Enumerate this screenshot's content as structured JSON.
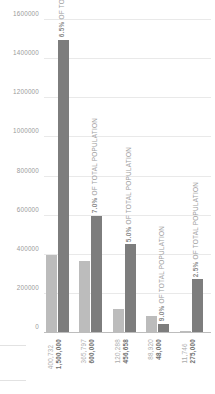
{
  "chart_data": {
    "type": "bar",
    "title": "",
    "subtitle": "",
    "xlabel": "",
    "ylabel": "",
    "ylim": [
      0,
      1600000
    ],
    "yticks": [
      0,
      200000,
      400000,
      600000,
      800000,
      1000000,
      1200000,
      1400000,
      1600000
    ],
    "ytick_labels": [
      "0",
      "200000",
      "400000",
      "600000",
      "800000",
      "1000000",
      "1200000",
      "1400000",
      "1600000"
    ],
    "grid": true,
    "legend": "none",
    "orientation": "vertical",
    "categories": [
      "1",
      "2",
      "3",
      "4",
      "5"
    ],
    "series": [
      {
        "name": "actual",
        "color": "#bcbcbc",
        "values": [
          400732,
          365797,
          120288,
          88920,
          11746
        ],
        "labels": [
          "400,732",
          "365,797",
          "120,288",
          "88,920",
          "11,746"
        ]
      },
      {
        "name": "target",
        "color": "#7d7d7d",
        "values": [
          1500000,
          600000,
          456658,
          48000,
          275000
        ],
        "labels": [
          "1,500,000",
          "600,000",
          "456,658",
          "48,000",
          "275,000"
        ]
      }
    ],
    "annotations": [
      "6.5% OF TOTAL POPULATION",
      "7.0% OF TOTAL POPULATION",
      "5.0% OF TOTAL POPULATION",
      "9.0% OF TOTAL POPULATION",
      "2.5% OF TOTAL POPULATION"
    ],
    "annotation_percents": [
      "6.5%",
      "7.0%",
      "5.0%",
      "9.0%",
      "2.5%"
    ],
    "annotation_suffix": "OF TOTAL POPULATION"
  },
  "colors": {
    "actual_bar": "#bcbcbc",
    "target_bar": "#7d7d7d",
    "gridline": "#e9e9e9",
    "axis": "#bdbdbd",
    "tick_text": "#9a9a9a",
    "background": "#ffffff"
  }
}
